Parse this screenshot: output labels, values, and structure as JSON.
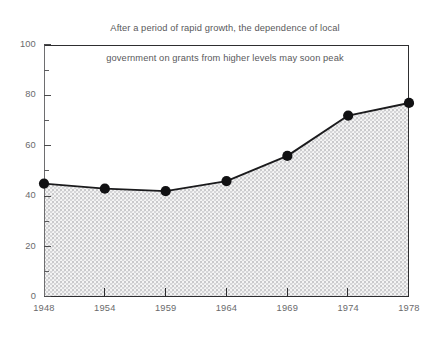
{
  "chart_data": {
    "type": "area",
    "title": "After a period of rapid growth, the dependence of local government on grants from higher levels may soon peak",
    "title_line_1": "After a period of rapid growth, the dependence of local",
    "title_line_2": "government on grants from higher levels may soon peak",
    "xlabel": "",
    "ylabel": "",
    "categories": [
      "1948",
      "1954",
      "1959",
      "1964",
      "1969",
      "1974",
      "1978"
    ],
    "x": [
      1948,
      1954,
      1959,
      1964,
      1969,
      1974,
      1978
    ],
    "values": [
      45,
      43,
      42,
      46,
      56,
      72,
      77
    ],
    "ylim": [
      0,
      100
    ],
    "y_ticks_major": [
      0,
      20,
      40,
      60,
      80,
      100
    ],
    "y_tick_labels": [
      "0",
      "20",
      "40",
      "60",
      "80",
      "100"
    ],
    "y_ticks_minor": [
      10,
      30,
      50,
      70,
      90
    ],
    "grid": false,
    "legend": null,
    "legend_position": "none",
    "marker": "filled-circle",
    "fill_pattern": "crosshatch-dotted",
    "colors": {
      "line": "#1b1b1d",
      "marker": "#111113",
      "fill": "#d2d2d4",
      "fill_background": "#f2f2f2",
      "axis": "#2e2e30",
      "tick_label": "#6a6a6c",
      "title": "#59595b"
    }
  }
}
